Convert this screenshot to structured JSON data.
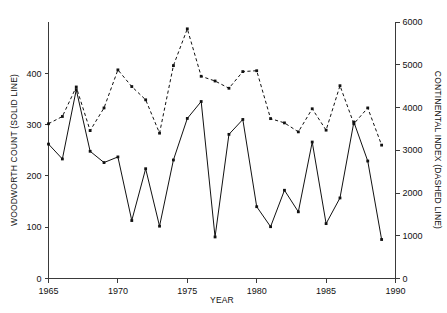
{
  "chart_data": {
    "type": "line",
    "title": "",
    "subtitle": "",
    "xlabel": "YEAR",
    "ylabel": "WOODWORTH COUNT (SOLID LINE)",
    "y2label": "CONTINENTAL INDEX (DASHED LINE)",
    "grid": false,
    "legend_position": "none",
    "x": [
      1965,
      1966,
      1967,
      1968,
      1969,
      1970,
      1971,
      1972,
      1973,
      1974,
      1975,
      1976,
      1977,
      1978,
      1979,
      1980,
      1981,
      1982,
      1983,
      1984,
      1985,
      1986,
      1987,
      1988,
      1989
    ],
    "xlim": [
      1965,
      1990
    ],
    "xticks": [
      1965,
      1970,
      1975,
      1980,
      1985,
      1990
    ],
    "xtick_labels": [
      "1965",
      "1970",
      "1975",
      "1980",
      "1985",
      "1990"
    ],
    "ylim": [
      0,
      500
    ],
    "yticks": [
      0,
      100,
      200,
      300,
      400
    ],
    "ytick_labels": [
      "0",
      "100",
      "200",
      "300",
      "400"
    ],
    "y2lim": [
      0,
      6000
    ],
    "y2ticks": [
      0,
      1000,
      2000,
      3000,
      4000,
      5000,
      6000
    ],
    "y2tick_labels": [
      "0",
      "1000",
      "2000",
      "3000",
      "4000",
      "5000",
      "6000"
    ],
    "series": [
      {
        "name": "WOODWORTH COUNT",
        "style": "solid",
        "axis": "left",
        "marker": "filled-square",
        "color": "#111111",
        "values": [
          262,
          233,
          368,
          248,
          226,
          237,
          113,
          214,
          102,
          231,
          312,
          345,
          81,
          281,
          310,
          140,
          101,
          172,
          130,
          266,
          107,
          157,
          305,
          229,
          76
        ]
      },
      {
        "name": "CONTINENTAL INDEX",
        "style": "dashed",
        "axis": "right",
        "marker": "filled-square",
        "color": "#111111",
        "values": [
          3620,
          3790,
          4480,
          3460,
          3990,
          4880,
          4490,
          4180,
          3400,
          4980,
          5840,
          4730,
          4620,
          4450,
          4840,
          4860,
          3740,
          3640,
          3430,
          3970,
          3470,
          4510,
          3620,
          3990,
          3120
        ]
      }
    ]
  },
  "axes": {
    "x_title": "YEAR",
    "y_left_title": "WOODWORTH COUNT (SOLID LINE)",
    "y_right_title": "CONTINENTAL INDEX (DASHED LINE)"
  }
}
